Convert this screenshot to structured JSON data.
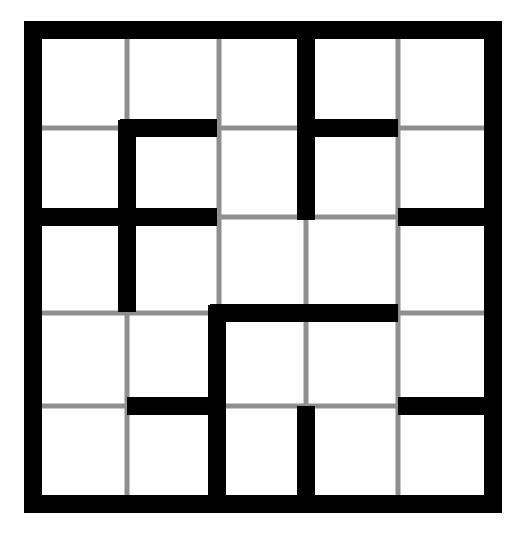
{
  "puzzle": {
    "type": "grid-regions",
    "rows": 5,
    "cols": 5,
    "colors": {
      "background": "#ffffff",
      "border": "#000000",
      "grid_line": "#8f8f8f",
      "wall": "#000000"
    },
    "geometry": {
      "left": 24,
      "top": 21,
      "right": 502,
      "bottom": 513,
      "border_width": 18,
      "wall_width": 18,
      "grid_line_width": 5,
      "col_lines": [
        127,
        219,
        306,
        398
      ],
      "row_lines": [
        128,
        217,
        313,
        406
      ]
    },
    "walls": [
      {
        "orientation": "v",
        "x": 306,
        "y1": 21,
        "y2": 220
      },
      {
        "orientation": "h",
        "y": 128,
        "x1": 120,
        "x2": 217
      },
      {
        "orientation": "v",
        "x": 127,
        "y1": 120,
        "y2": 312
      },
      {
        "orientation": "h",
        "y": 128,
        "x1": 306,
        "x2": 398
      },
      {
        "orientation": "h",
        "y": 217,
        "x1": 24,
        "x2": 217
      },
      {
        "orientation": "h",
        "y": 217,
        "x1": 398,
        "x2": 502
      },
      {
        "orientation": "h",
        "y": 313,
        "x1": 210,
        "x2": 398
      },
      {
        "orientation": "v",
        "x": 217,
        "y1": 305,
        "y2": 513
      },
      {
        "orientation": "h",
        "y": 406,
        "x1": 127,
        "x2": 217
      },
      {
        "orientation": "v",
        "x": 306,
        "y1": 406,
        "y2": 513
      },
      {
        "orientation": "h",
        "y": 406,
        "x1": 398,
        "x2": 502
      }
    ]
  }
}
